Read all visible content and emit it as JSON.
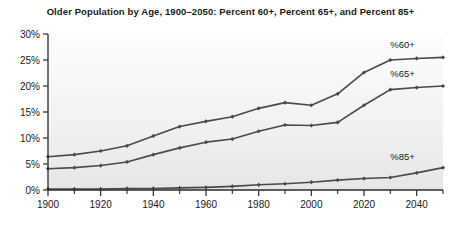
{
  "chart_data": {
    "type": "line",
    "title": "Older Population by Age, 1900–2050: Percent 60+, Percent 65+, and Percent 85+",
    "xlabel": "",
    "ylabel": "",
    "xlim": [
      1900,
      2050
    ],
    "ylim": [
      0,
      30
    ],
    "grid": false,
    "legend_position": "inline-right",
    "x": [
      1900,
      1910,
      1920,
      1930,
      1940,
      1950,
      1960,
      1970,
      1980,
      1990,
      2000,
      2010,
      2020,
      2030,
      2040,
      2050
    ],
    "x_tick_labels": [
      "1900",
      "1920",
      "1940",
      "1960",
      "1980",
      "2000",
      "2020",
      "2040"
    ],
    "x_tick_values": [
      1900,
      1920,
      1940,
      1960,
      1980,
      2000,
      2020,
      2040
    ],
    "x_minor_tick_values": [
      1910,
      1930,
      1950,
      1970,
      1990,
      2010,
      2030,
      2050
    ],
    "y_tick_labels": [
      "0%",
      "5%",
      "10%",
      "15%",
      "20%",
      "25%",
      "30%"
    ],
    "y_tick_values": [
      0,
      5,
      10,
      15,
      20,
      25,
      30
    ],
    "series": [
      {
        "name": "%60+",
        "label": "%60+",
        "color": "#4a4a4a",
        "values": [
          6.4,
          6.8,
          7.5,
          8.5,
          10.4,
          12.2,
          13.2,
          14.1,
          15.7,
          16.8,
          16.3,
          18.5,
          22.6,
          25.0,
          25.3,
          25.5
        ]
      },
      {
        "name": "%65+",
        "label": "%65+",
        "color": "#4a4a4a",
        "values": [
          4.1,
          4.3,
          4.7,
          5.4,
          6.8,
          8.1,
          9.2,
          9.8,
          11.3,
          12.5,
          12.4,
          13.0,
          16.3,
          19.3,
          19.7,
          20.0
        ]
      },
      {
        "name": "%85+",
        "label": "%85+",
        "color": "#4a4a4a",
        "values": [
          0.2,
          0.2,
          0.2,
          0.3,
          0.3,
          0.4,
          0.5,
          0.7,
          1.0,
          1.2,
          1.5,
          1.9,
          2.2,
          2.4,
          3.3,
          4.3
        ]
      }
    ]
  },
  "labels": {
    "series_60": "%60+",
    "series_65": "%65+",
    "series_85": "%85+"
  }
}
